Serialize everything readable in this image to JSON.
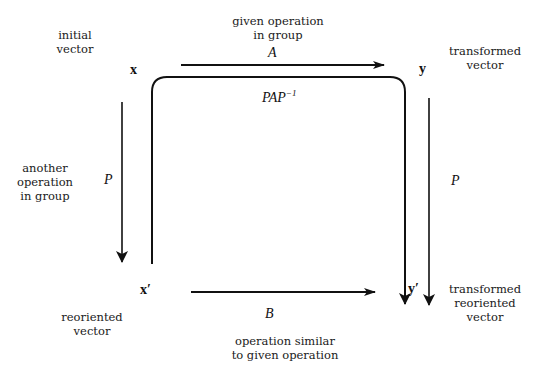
{
  "nodes": {
    "x": {
      "symbol": "x",
      "description": "initial\nvector"
    },
    "y": {
      "symbol": "y",
      "description": "transformed\nvector"
    },
    "x_prime": {
      "symbol": "x′",
      "description": "reoriented\nvector"
    },
    "y_prime": {
      "symbol": "y′",
      "description": "transformed\nreoriented\nvector"
    }
  },
  "edges": {
    "A": {
      "label": "A",
      "description": "given operation\nin group",
      "from": "x",
      "to": "y"
    },
    "P_left": {
      "label": "P",
      "description": "another\noperation\nin group",
      "from": "x",
      "to": "x′"
    },
    "P_right": {
      "label": "P",
      "from": "y",
      "to": "y′"
    },
    "B": {
      "label": "B",
      "description": "operation similar\nto given operation",
      "from": "x′",
      "to": "y′"
    },
    "PAP_inv": {
      "label_base": "PAP",
      "label_sup": "−1",
      "from": "x′",
      "to": "y′"
    }
  },
  "colors": {
    "line": "#111111",
    "text": "#1a1a1a",
    "background": "#ffffff"
  }
}
